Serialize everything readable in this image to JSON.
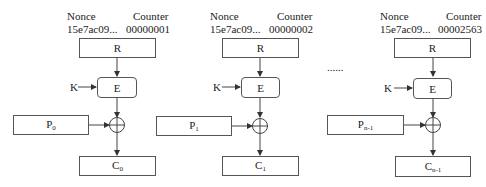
{
  "diagram": {
    "ellipsis": "......",
    "blocks": [
      {
        "nonce_label": "Nonce",
        "counter_label": "Counter",
        "nonce_value": "15e7ac09...",
        "counter_value": "00000001",
        "register_label": "R",
        "encrypt_label": "E",
        "key_label": "K",
        "plaintext_base": "P",
        "plaintext_sub": "0",
        "ciphertext_base": "C",
        "ciphertext_sub": "0"
      },
      {
        "nonce_label": "Nonce",
        "counter_label": "Counter",
        "nonce_value": "15e7ac09...",
        "counter_value": "00000002",
        "register_label": "R",
        "encrypt_label": "E",
        "key_label": "K",
        "plaintext_base": "P",
        "plaintext_sub": "1",
        "ciphertext_base": "C",
        "ciphertext_sub": "1"
      },
      {
        "nonce_label": "Nonce",
        "counter_label": "Counter",
        "nonce_value": "15e7ac09...",
        "counter_value": "00002563",
        "register_label": "R",
        "encrypt_label": "E",
        "key_label": "K",
        "plaintext_base": "P",
        "plaintext_sub": "n-1",
        "ciphertext_base": "C",
        "ciphertext_sub": "n-1"
      }
    ],
    "colors": {
      "line": "#444444",
      "box_border": "#555555",
      "text": "#222222"
    }
  }
}
